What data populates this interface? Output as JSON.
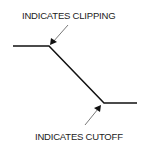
{
  "labels": {
    "clipping": "INDICATES CLIPPING",
    "cutoff": "INDICATES CUTOFF"
  },
  "colors": {
    "line": "#111111",
    "arrow": "#555555"
  }
}
